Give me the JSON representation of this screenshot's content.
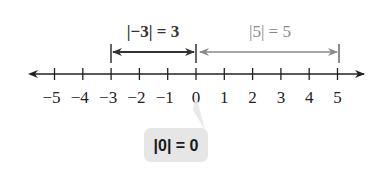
{
  "number_line": {
    "min": -5,
    "max": 5,
    "ticks": [
      {
        "value": -5,
        "label": "−5"
      },
      {
        "value": -4,
        "label": "−4"
      },
      {
        "value": -3,
        "label": "−3"
      },
      {
        "value": -2,
        "label": "−2"
      },
      {
        "value": -1,
        "label": "−1"
      },
      {
        "value": 0,
        "label": "0"
      },
      {
        "value": 1,
        "label": "1"
      },
      {
        "value": 2,
        "label": "2"
      },
      {
        "value": 3,
        "label": "3"
      },
      {
        "value": 4,
        "label": "4"
      },
      {
        "value": 5,
        "label": "5"
      }
    ]
  },
  "annotations": {
    "neg_three": {
      "label": "|−3| = 3",
      "from": -3,
      "to": 0,
      "color": "#333333"
    },
    "pos_five": {
      "label": "|5| = 5",
      "from": 0,
      "to": 5,
      "color": "#8a8a8a"
    },
    "zero": {
      "label": "|0| = 0",
      "callout_bg": "#e6e6e6"
    }
  }
}
